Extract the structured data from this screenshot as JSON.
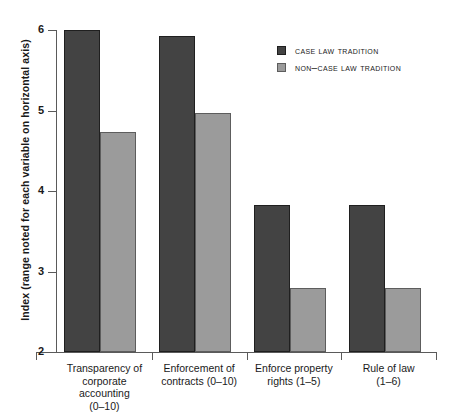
{
  "chart_data": {
    "type": "bar",
    "title": "",
    "xlabel": "",
    "ylabel": "Index (range noted for each variable on horizontal axis)",
    "ylim": [
      2,
      6
    ],
    "yticks": [
      2,
      3,
      4,
      5,
      6
    ],
    "ytick_labels": [
      "2",
      "3",
      "4",
      "5",
      "6"
    ],
    "grid": false,
    "legend_position": "top-right",
    "categories": [
      "Transparency of corporate accounting (0–10)",
      "Enforcement of contracts (0–10)",
      "Enforce property rights (1–5)",
      "Rule of law (1–6)"
    ],
    "category_lines": [
      [
        "Transparency of",
        "corporate",
        "accounting",
        "(0–10)"
      ],
      [
        "Enforcement of",
        "contracts (0–10)"
      ],
      [
        "Enforce property",
        "rights (1–5)"
      ],
      [
        "Rule of law",
        "(1–6)"
      ]
    ],
    "series": [
      {
        "name": "Case law tradition",
        "color": "#434343",
        "values": [
          6.0,
          5.93,
          3.83,
          3.83
        ]
      },
      {
        "name": "Non–case law tradition",
        "color": "#9b9b9b",
        "values": [
          4.73,
          4.97,
          2.8,
          2.8
        ]
      }
    ]
  },
  "legend": {
    "items": [
      {
        "label": "Case law tradition",
        "swatch": "dark"
      },
      {
        "label": "Non–case law tradition",
        "swatch": "light"
      }
    ]
  },
  "axis": {
    "y_title": "Index (range noted for each variable on horizontal axis)"
  }
}
